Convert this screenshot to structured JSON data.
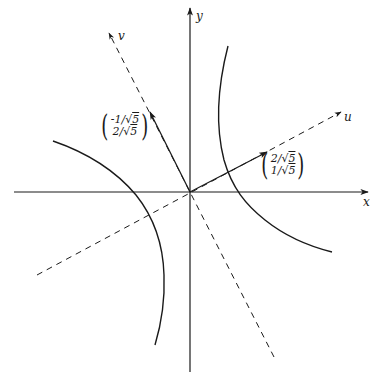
{
  "figure": {
    "axes": {
      "x_label": "x",
      "y_label": "y",
      "u_label": "u",
      "v_label": "v"
    },
    "vectors": {
      "u_vector": {
        "top": "2/√5",
        "bottom": "1/√5",
        "top_num": "2/",
        "bottom_num": "1/",
        "radicand": "5"
      },
      "v_vector": {
        "top": "-1/√5",
        "bottom": "2/√5",
        "top_num": "-1/",
        "bottom_num": "2/",
        "radicand": "5"
      }
    },
    "colors": {
      "stroke": "#1a1a1a",
      "background": "#ffffff"
    },
    "caption": ""
  }
}
